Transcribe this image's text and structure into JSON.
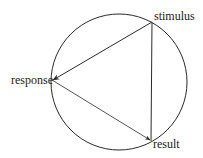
{
  "diagram": {
    "type": "cycle",
    "colors": {
      "stroke": "#2a2a2a",
      "text": "#1a1a1a",
      "background": "#ffffff"
    },
    "circle": {
      "cx": 119,
      "cy": 82,
      "r": 68
    },
    "nodes": [
      {
        "id": "stimulus",
        "label": "stimulus",
        "x": 152,
        "y": 22
      },
      {
        "id": "response",
        "label": "response",
        "x": 52,
        "y": 80
      },
      {
        "id": "result",
        "label": "result",
        "x": 151,
        "y": 141
      }
    ],
    "edges": [
      {
        "from": "stimulus",
        "to": "response",
        "arrow": true
      },
      {
        "from": "response",
        "to": "result",
        "arrow": true
      },
      {
        "from": "stimulus",
        "to": "result",
        "arrow": false
      }
    ]
  }
}
